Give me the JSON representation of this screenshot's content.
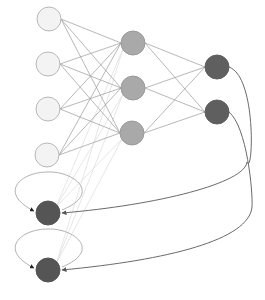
{
  "diagram": {
    "type": "recurrent-neural-network",
    "colors": {
      "background": "#ffffff",
      "input_fill": "#f3f3f3",
      "input_stroke": "#b8b8b8",
      "hidden_fill": "#a9a9a9",
      "hidden_stroke": "#9a9a9a",
      "output_fill": "#5f5f5f",
      "context_fill": "#555555",
      "edge_strong": "#9a9a9a",
      "edge_faint": "#e0e0e0",
      "feedback": "#6a6a6a",
      "loop": "#a8a8a8"
    },
    "node_radius": 12,
    "layers": {
      "input": [
        {
          "id": "i1",
          "x": 49,
          "y": 19
        },
        {
          "id": "i2",
          "x": 48,
          "y": 64
        },
        {
          "id": "i3",
          "x": 48,
          "y": 109
        },
        {
          "id": "i4",
          "x": 47,
          "y": 155
        }
      ],
      "hidden": [
        {
          "id": "h1",
          "x": 133,
          "y": 43
        },
        {
          "id": "h2",
          "x": 133,
          "y": 88
        },
        {
          "id": "h3",
          "x": 132,
          "y": 133
        }
      ],
      "output": [
        {
          "id": "o1",
          "x": 217,
          "y": 67
        },
        {
          "id": "o2",
          "x": 217,
          "y": 112
        }
      ],
      "context": [
        {
          "id": "c1",
          "x": 48,
          "y": 213
        },
        {
          "id": "c2",
          "x": 48,
          "y": 270
        }
      ]
    },
    "feedback_edges": [
      {
        "from": "o1",
        "to": "c1"
      },
      {
        "from": "o2",
        "to": "c2"
      }
    ],
    "self_loops": [
      "c1",
      "c2"
    ]
  }
}
